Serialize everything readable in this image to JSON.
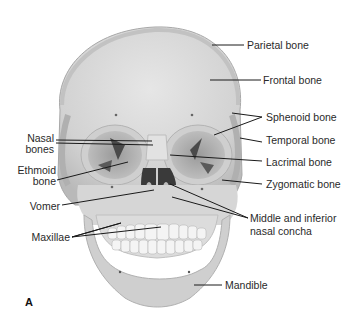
{
  "figure": {
    "panel_letter": "A",
    "labels_right": [
      {
        "text": "Parietal bone"
      },
      {
        "text": "Frontal bone"
      },
      {
        "text": "Sphenoid bone"
      },
      {
        "text": "Temporal bone"
      },
      {
        "text": "Lacrimal bone"
      },
      {
        "text": "Zygomatic bone"
      },
      {
        "text": "Middle and inferior"
      },
      {
        "text": "nasal concha"
      },
      {
        "text": "Mandible"
      }
    ],
    "labels_left": [
      {
        "text": "Nasal"
      },
      {
        "text": "bones"
      },
      {
        "text": "Ethmoid"
      },
      {
        "text": "bone"
      },
      {
        "text": "Vomer"
      },
      {
        "text": "Maxillae"
      }
    ],
    "colors": {
      "bone": "#d9d9d9",
      "bone_shade": "#bdbdbd",
      "bone_light": "#ececec",
      "orbit": "#a9a9a9",
      "cavity": "#3a3a3a",
      "leader": "#1a1a1a",
      "text": "#2a2a2a"
    }
  }
}
